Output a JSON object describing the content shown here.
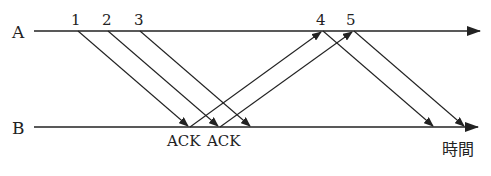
{
  "diagram": {
    "timelines": [
      {
        "id": "A",
        "label": "A"
      },
      {
        "id": "B",
        "label": "B"
      }
    ],
    "time_label": "時間",
    "ack_labels": [
      "ACK",
      "ACK"
    ],
    "packets": [
      {
        "label": "1",
        "from": "A",
        "to": "B"
      },
      {
        "label": "2",
        "from": "A",
        "to": "B"
      },
      {
        "label": "3",
        "from": "A",
        "to": "B"
      },
      {
        "label": "4",
        "from": "A",
        "to": "B"
      },
      {
        "label": "5",
        "from": "A",
        "to": "B"
      }
    ],
    "acks": [
      {
        "label": "ACK",
        "from": "B",
        "to": "A",
        "triggers": "4"
      },
      {
        "label": "ACK",
        "from": "B",
        "to": "A",
        "triggers": "5"
      }
    ],
    "colors": {
      "line": "#222222",
      "text": "#222222"
    }
  }
}
